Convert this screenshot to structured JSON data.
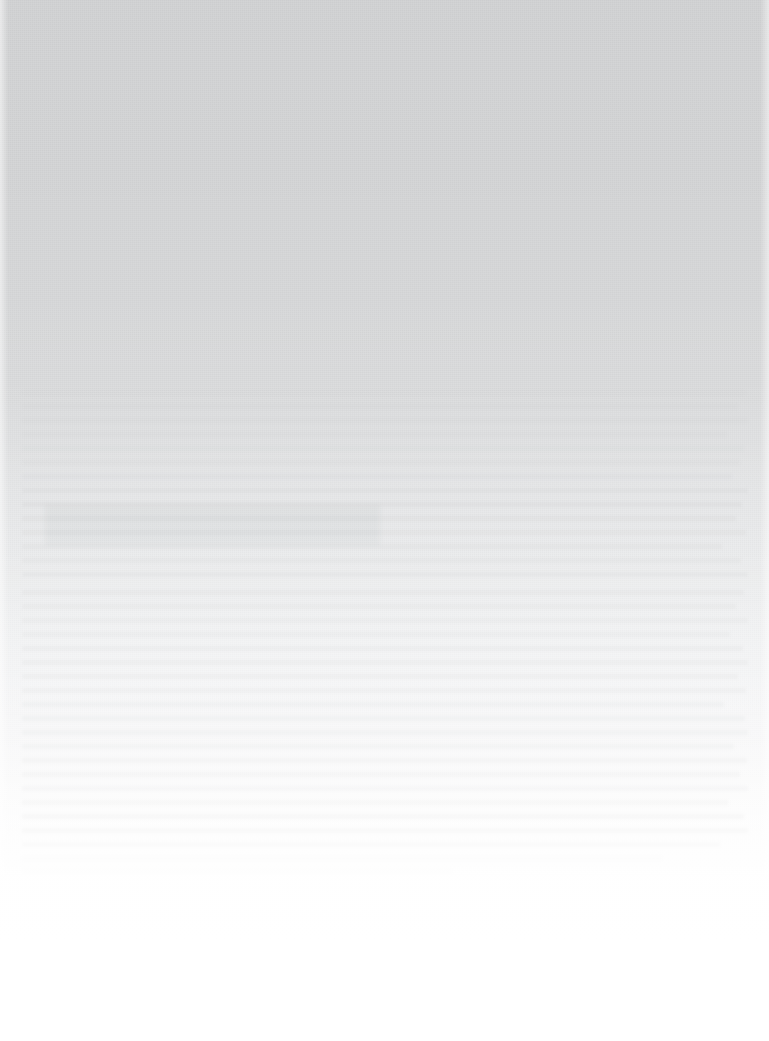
{
  "page": {
    "width_px": 769,
    "height_px": 1041,
    "legible_text": "",
    "description_note": "No legible text is present in the image at any magnification."
  },
  "appearance": {
    "background_top_color": "#d3d4d5",
    "background_mid_color": "#e9eaeb",
    "background_bottom_color": "#ffffff",
    "gradient_direction": "top-to-bottom",
    "gradient_stops": [
      {
        "y": 0,
        "color": "#d3d4d5"
      },
      {
        "y": 170,
        "color": "#d5d6d7"
      },
      {
        "y": 400,
        "color": "#dddedf"
      },
      {
        "y": 560,
        "color": "#eaebec"
      },
      {
        "y": 730,
        "color": "#f6f6f7"
      },
      {
        "y": 880,
        "color": "#fefefe"
      },
      {
        "y": 1041,
        "color": "#ffffff"
      }
    ],
    "texture": "paper-grain",
    "texture_color": "#787880"
  },
  "margins": {
    "left_strip_width_px": 8,
    "right_strip_width_px": 9,
    "strip_color": "#ffffff"
  },
  "ghost_content": {
    "ink_color": "#696c70",
    "text_region": {
      "x": 20,
      "y": 388,
      "width": 730,
      "height": 482
    },
    "blotch": {
      "x": 45,
      "y": 505,
      "width": 335,
      "height": 40
    },
    "lines": [
      {
        "x": 22,
        "y": 390,
        "width": 724,
        "height": 5,
        "opacity": 0.22
      },
      {
        "x": 22,
        "y": 404,
        "width": 716,
        "height": 5,
        "opacity": 0.24
      },
      {
        "x": 22,
        "y": 418,
        "width": 726,
        "height": 5,
        "opacity": 0.26
      },
      {
        "x": 22,
        "y": 432,
        "width": 705,
        "height": 5,
        "opacity": 0.28
      },
      {
        "x": 22,
        "y": 446,
        "width": 722,
        "height": 5,
        "opacity": 0.32
      },
      {
        "x": 22,
        "y": 460,
        "width": 718,
        "height": 5,
        "opacity": 0.36
      },
      {
        "x": 22,
        "y": 474,
        "width": 710,
        "height": 5,
        "opacity": 0.4
      },
      {
        "x": 22,
        "y": 488,
        "width": 726,
        "height": 5,
        "opacity": 0.46
      },
      {
        "x": 22,
        "y": 502,
        "width": 720,
        "height": 5,
        "opacity": 0.52
      },
      {
        "x": 22,
        "y": 516,
        "width": 714,
        "height": 5,
        "opacity": 0.58
      },
      {
        "x": 22,
        "y": 530,
        "width": 724,
        "height": 5,
        "opacity": 0.6
      },
      {
        "x": 22,
        "y": 544,
        "width": 700,
        "height": 5,
        "opacity": 0.58
      },
      {
        "x": 22,
        "y": 558,
        "width": 719,
        "height": 5,
        "opacity": 0.56
      },
      {
        "x": 22,
        "y": 572,
        "width": 726,
        "height": 5,
        "opacity": 0.54
      },
      {
        "x": 22,
        "y": 590,
        "width": 722,
        "height": 5,
        "opacity": 0.56
      },
      {
        "x": 22,
        "y": 604,
        "width": 714,
        "height": 5,
        "opacity": 0.58
      },
      {
        "x": 22,
        "y": 618,
        "width": 726,
        "height": 5,
        "opacity": 0.6
      },
      {
        "x": 22,
        "y": 632,
        "width": 708,
        "height": 5,
        "opacity": 0.6
      },
      {
        "x": 22,
        "y": 646,
        "width": 721,
        "height": 5,
        "opacity": 0.62
      },
      {
        "x": 22,
        "y": 660,
        "width": 726,
        "height": 5,
        "opacity": 0.62
      },
      {
        "x": 22,
        "y": 674,
        "width": 716,
        "height": 5,
        "opacity": 0.64
      },
      {
        "x": 22,
        "y": 688,
        "width": 724,
        "height": 5,
        "opacity": 0.64
      },
      {
        "x": 22,
        "y": 702,
        "width": 702,
        "height": 5,
        "opacity": 0.66
      },
      {
        "x": 22,
        "y": 716,
        "width": 723,
        "height": 5,
        "opacity": 0.66
      },
      {
        "x": 22,
        "y": 730,
        "width": 726,
        "height": 5,
        "opacity": 0.68
      },
      {
        "x": 22,
        "y": 744,
        "width": 712,
        "height": 5,
        "opacity": 0.7
      },
      {
        "x": 22,
        "y": 758,
        "width": 725,
        "height": 5,
        "opacity": 0.72
      },
      {
        "x": 22,
        "y": 772,
        "width": 718,
        "height": 5,
        "opacity": 0.74
      },
      {
        "x": 22,
        "y": 786,
        "width": 726,
        "height": 5,
        "opacity": 0.78
      },
      {
        "x": 22,
        "y": 800,
        "width": 706,
        "height": 5,
        "opacity": 0.82
      },
      {
        "x": 22,
        "y": 814,
        "width": 722,
        "height": 5,
        "opacity": 0.88
      },
      {
        "x": 22,
        "y": 828,
        "width": 726,
        "height": 5,
        "opacity": 0.84
      },
      {
        "x": 22,
        "y": 842,
        "width": 698,
        "height": 5,
        "opacity": 0.62
      },
      {
        "x": 22,
        "y": 856,
        "width": 640,
        "height": 5,
        "opacity": 0.34
      },
      {
        "x": 22,
        "y": 868,
        "width": 430,
        "height": 5,
        "opacity": 0.16
      }
    ]
  }
}
